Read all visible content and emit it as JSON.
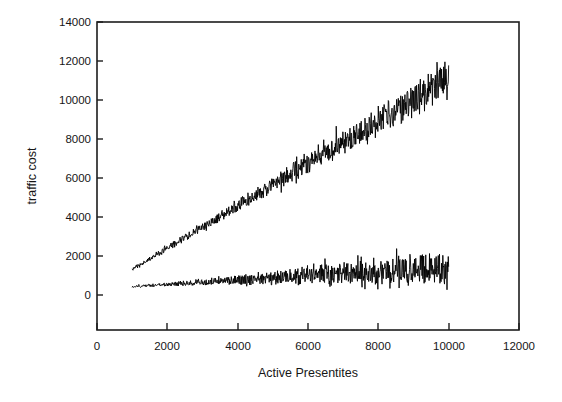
{
  "figure": {
    "background_color": "#ffffff",
    "ink_color": "#1d1d1a"
  },
  "chart_data": {
    "type": "line",
    "title": "",
    "subtitle": "",
    "xlabel": "Active Presentites",
    "ylabel": "traffic cost",
    "xlim": [
      0,
      12000
    ],
    "ylim": [
      -2000,
      14000
    ],
    "x_ticks": [
      0,
      2000,
      4000,
      6000,
      8000,
      10000,
      12000
    ],
    "x_tick_labels": [
      "0",
      "2000",
      "4000",
      "6000",
      "8000",
      "10000",
      "12000"
    ],
    "y_ticks": [
      0,
      2000,
      4000,
      6000,
      8000,
      10000,
      12000,
      14000
    ],
    "y_tick_labels": [
      "0",
      "2000",
      "4000",
      "6000",
      "8000",
      "10000",
      "12000",
      "14000"
    ],
    "grid": false,
    "legend": null,
    "frame": "full-box",
    "x_data_range": [
      1000,
      10000
    ],
    "series": [
      {
        "name": "upper traffic cost series",
        "color": "#000000",
        "description": "steeply rising noisy band from about 1150 at x=1000 to about 11000 at x=10000; jitter amplitude grows with x",
        "trend_start": 1150,
        "trend_end": 11050,
        "noise_start": 90,
        "noise_end": 900,
        "value_at_x": [
          {
            "x": 1000,
            "value": 1150
          },
          {
            "x": 2000,
            "value": 2230
          },
          {
            "x": 3000,
            "value": 3320
          },
          {
            "x": 4000,
            "value": 4420
          },
          {
            "x": 5000,
            "value": 5520
          },
          {
            "x": 6000,
            "value": 6620
          },
          {
            "x": 7000,
            "value": 7720
          },
          {
            "x": 8000,
            "value": 8800
          },
          {
            "x": 9000,
            "value": 9900
          },
          {
            "x": 10000,
            "value": 11000
          }
        ]
      },
      {
        "name": "lower traffic cost series",
        "color": "#000000",
        "description": "nearly flat slowly rising noisy band from about 250 at x=1000 to about 1250 at x=10000; jitter amplitude grows strongly with x",
        "trend_start": 260,
        "trend_end": 1260,
        "noise_start": 45,
        "noise_end": 850,
        "value_at_x": [
          {
            "x": 1000,
            "value": 260
          },
          {
            "x": 2000,
            "value": 370
          },
          {
            "x": 3000,
            "value": 480
          },
          {
            "x": 4000,
            "value": 590
          },
          {
            "x": 5000,
            "value": 700
          },
          {
            "x": 6000,
            "value": 810
          },
          {
            "x": 7000,
            "value": 930
          },
          {
            "x": 8000,
            "value": 1040
          },
          {
            "x": 9000,
            "value": 1150
          },
          {
            "x": 10000,
            "value": 1260
          }
        ]
      }
    ]
  },
  "geometry": {
    "plot_left_px": 97,
    "plot_right_px": 519,
    "plot_top_px": 22,
    "plot_bottom_px": 330,
    "y_zero_px": 295,
    "px_per_2000_y": 39,
    "px_per_2000_x": 70.3
  }
}
